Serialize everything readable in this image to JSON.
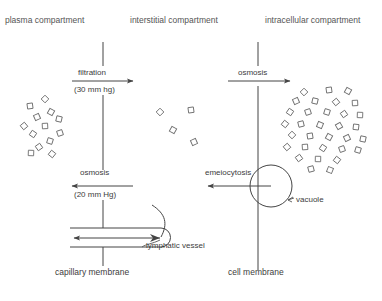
{
  "diagram": {
    "headers": [
      {
        "id": "plasma",
        "label": "plasma compartment",
        "x": 5,
        "y": 16
      },
      {
        "id": "interstitial",
        "label": "interstitial compartment",
        "x": 130,
        "y": 16
      },
      {
        "id": "intracellular",
        "label": "intracellular compartment",
        "x": 265,
        "y": 16
      }
    ],
    "membranes": [
      {
        "id": "capillary-membrane",
        "label": "capillary membrane",
        "x": 103,
        "label_x": 55,
        "label_y": 272,
        "top": 42,
        "bottom": 266
      },
      {
        "id": "cell-membrane",
        "label": "cell membrane",
        "x": 258,
        "label_x": 228,
        "label_y": 272,
        "top": 42,
        "bottom": 270
      }
    ],
    "processes": [
      {
        "id": "filtration",
        "label": "filtration",
        "value": "(30 mm hg)",
        "direction": "right",
        "label_x": 78,
        "label_y": 69,
        "value_x": 74,
        "value_y": 91,
        "arrow_y": 81,
        "arrow_x1": 72,
        "arrow_x2": 133
      },
      {
        "id": "osmosis-capillary",
        "label": "osmosis",
        "value": "(20 mm Hg)",
        "direction": "left",
        "label_x": 80,
        "label_y": 174,
        "value_x": 74,
        "value_y": 196,
        "arrow_y": 186,
        "arrow_x1": 133,
        "arrow_x2": 72
      },
      {
        "id": "osmosis-cell",
        "label": "osmosis",
        "value": "",
        "direction": "right",
        "label_x": 238,
        "label_y": 69,
        "value_x": 0,
        "value_y": 0,
        "arrow_y": 81,
        "arrow_x1": 228,
        "arrow_x2": 290
      },
      {
        "id": "emeiocytosis",
        "label": "emeiocytosis",
        "value": "",
        "direction": "left",
        "label_x": 205,
        "label_y": 174,
        "value_x": 0,
        "value_y": 0,
        "arrow_y": 186,
        "arrow_x1": 271,
        "arrow_x2": 208
      }
    ],
    "structures": [
      {
        "id": "vacuole",
        "label": "vacuole",
        "label_x": 296,
        "label_y": 200,
        "cx": 271,
        "cy": 186,
        "r": 21
      },
      {
        "id": "lymphatic-vessel",
        "label": "lymphatic vessel",
        "label_x": 146,
        "label_y": 246,
        "x": 70,
        "y": 228,
        "width": 100,
        "height": 19
      }
    ],
    "solute_clusters": [
      {
        "id": "plasma-solutes",
        "compartment": "plasma compartment",
        "count": 13,
        "points": [
          [
            45,
            99
          ],
          [
            30,
            106
          ],
          [
            51,
            112
          ],
          [
            37,
            117
          ],
          [
            59,
            119
          ],
          [
            24,
            126
          ],
          [
            45,
            126
          ],
          [
            33,
            134
          ],
          [
            60,
            133
          ],
          [
            50,
            141
          ],
          [
            39,
            147
          ],
          [
            31,
            153
          ],
          [
            52,
            154
          ]
        ]
      },
      {
        "id": "interstitial-solutes",
        "compartment": "interstitial compartment",
        "count": 4,
        "points": [
          [
            160,
            112
          ],
          [
            191,
            110
          ],
          [
            173,
            130
          ],
          [
            194,
            142
          ]
        ]
      },
      {
        "id": "intracellular-solutes",
        "compartment": "intracellular compartment",
        "count": 31,
        "points": [
          [
            304,
            92
          ],
          [
            329,
            90
          ],
          [
            348,
            91
          ],
          [
            296,
            101
          ],
          [
            315,
            101
          ],
          [
            336,
            102
          ],
          [
            355,
            103
          ],
          [
            290,
            112
          ],
          [
            308,
            112
          ],
          [
            327,
            112
          ],
          [
            344,
            114
          ],
          [
            360,
            115
          ],
          [
            285,
            124
          ],
          [
            301,
            124
          ],
          [
            320,
            125
          ],
          [
            339,
            126
          ],
          [
            356,
            127
          ],
          [
            292,
            135
          ],
          [
            310,
            136
          ],
          [
            329,
            137
          ],
          [
            347,
            138
          ],
          [
            363,
            139
          ],
          [
            287,
            147
          ],
          [
            305,
            147
          ],
          [
            323,
            148
          ],
          [
            342,
            149
          ],
          [
            358,
            150
          ],
          [
            299,
            158
          ],
          [
            318,
            159
          ],
          [
            337,
            160
          ],
          [
            311,
            169
          ],
          [
            330,
            170
          ]
        ]
      }
    ]
  }
}
